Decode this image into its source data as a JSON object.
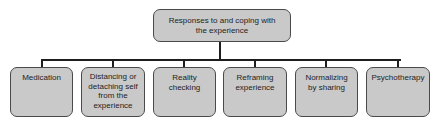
{
  "diagram": {
    "type": "hierarchy",
    "root": {
      "label": "Responses to and coping with the experience",
      "lines": [
        "Responses to and coping with",
        "the experience"
      ]
    },
    "children": [
      {
        "label": "Medication",
        "lines": [
          "Medication"
        ]
      },
      {
        "label": "Distancing or detaching self from the experience",
        "lines": [
          "Distancing or",
          "detaching self",
          "from the",
          "experience"
        ]
      },
      {
        "label": "Reality checking",
        "lines": [
          "Reality",
          "checking"
        ]
      },
      {
        "label": "Reframing experience",
        "lines": [
          "Reframing",
          "experience"
        ]
      },
      {
        "label": "Normalizing by sharing",
        "lines": [
          "Normalizing",
          "by sharing"
        ]
      },
      {
        "label": "Psychotherapy",
        "lines": [
          "Psychotherapy"
        ]
      }
    ],
    "colors": {
      "box_fill": "#c9c9c9",
      "box_border": "#4a4a4a",
      "connector": "#1e1e1e",
      "text": "#1e1e1e"
    }
  }
}
